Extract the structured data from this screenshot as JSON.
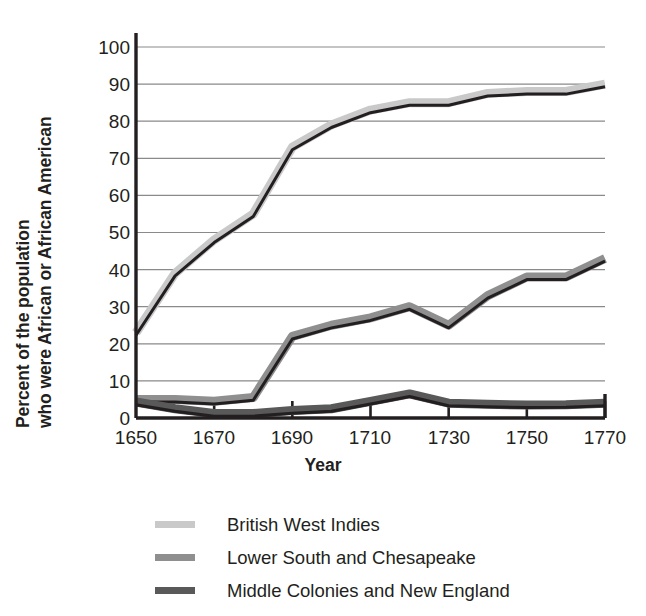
{
  "chart_data": {
    "type": "line",
    "title": "",
    "xlabel": "Year",
    "ylabel_line1": "Percent of the population",
    "ylabel_line2": "who were African or African American",
    "x": [
      1650,
      1660,
      1670,
      1680,
      1690,
      1700,
      1710,
      1720,
      1730,
      1740,
      1750,
      1760,
      1770
    ],
    "xticks": [
      "1650",
      "1670",
      "1690",
      "1710",
      "1730",
      "1750",
      "1770"
    ],
    "xtick_values": [
      1650,
      1670,
      1690,
      1710,
      1730,
      1750,
      1770
    ],
    "yticks": [
      "0",
      "10",
      "20",
      "30",
      "40",
      "50",
      "60",
      "70",
      "80",
      "90",
      "100"
    ],
    "ytick_values": [
      0,
      10,
      20,
      30,
      40,
      50,
      60,
      70,
      80,
      90,
      100
    ],
    "xlim": [
      1650,
      1770
    ],
    "ylim": [
      0,
      100
    ],
    "grid": true,
    "legend_position": "below",
    "series": [
      {
        "name": "British West Indies",
        "color": "#c9c9c9",
        "outline": "#231f20",
        "values": [
          23,
          39,
          48,
          55,
          73,
          79,
          83,
          85,
          85,
          87.5,
          88,
          88,
          90
        ]
      },
      {
        "name": "Lower South and Chesapeake",
        "color": "#8f8f8f",
        "outline": "#231f20",
        "values": [
          5,
          5,
          4.5,
          5.5,
          22,
          25,
          27,
          30,
          25,
          33,
          38,
          38,
          43
        ]
      },
      {
        "name": "Middle Colonies and New England",
        "color": "#595959",
        "outline": "#231f20",
        "values": [
          4.3,
          2.5,
          1.2,
          1.2,
          2,
          2.5,
          4.5,
          6.5,
          4,
          3.7,
          3.5,
          3.6,
          4
        ]
      }
    ]
  },
  "legend": {
    "items": [
      {
        "label": "British West Indies",
        "color": "#c9c9c9"
      },
      {
        "label": "Lower South and Chesapeake",
        "color": "#8f8f8f"
      },
      {
        "label": "Middle Colonies and New England",
        "color": "#595959"
      }
    ]
  },
  "axes": {
    "axis_color": "#231f20",
    "grid_color": "#8a8a8a"
  }
}
